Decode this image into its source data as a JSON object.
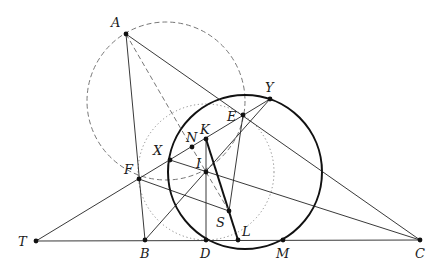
{
  "figure": {
    "type": "geometry-diagram",
    "points": {
      "A": {
        "label": "A",
        "x": 126,
        "y": 34
      },
      "B": {
        "label": "B",
        "x": 145,
        "y": 240
      },
      "C": {
        "label": "C",
        "x": 420,
        "y": 240
      },
      "T": {
        "label": "T",
        "x": 36,
        "y": 241
      },
      "D": {
        "label": "D",
        "x": 206,
        "y": 240
      },
      "L": {
        "label": "L",
        "x": 238,
        "y": 240
      },
      "M": {
        "label": "M",
        "x": 283,
        "y": 240
      },
      "F": {
        "label": "F",
        "x": 139,
        "y": 179
      },
      "E": {
        "label": "E",
        "x": 243,
        "y": 115
      },
      "Y": {
        "label": "Y",
        "x": 270,
        "y": 99
      },
      "X": {
        "label": "X",
        "x": 170,
        "y": 160
      },
      "N": {
        "label": "N",
        "x": 192,
        "y": 147
      },
      "K": {
        "label": "K",
        "x": 206,
        "y": 139
      },
      "I": {
        "label": "I",
        "x": 206,
        "y": 172
      },
      "S": {
        "label": "S",
        "x": 229,
        "y": 211
      }
    },
    "circles": [
      {
        "name": "bold-circle",
        "style": "solid-bold",
        "cx": 245,
        "cy": 172,
        "r": 77
      },
      {
        "name": "dashed-circle",
        "style": "dashed",
        "cx": 166,
        "cy": 101,
        "r": 79
      },
      {
        "name": "dotted-circle",
        "style": "dotted",
        "cx": 206,
        "cy": 172,
        "r": 68
      }
    ],
    "segments": [
      {
        "from": "A",
        "to": "B",
        "style": "solid"
      },
      {
        "from": "A",
        "to": "C",
        "style": "solid"
      },
      {
        "from": "T",
        "to": "C",
        "style": "solid"
      },
      {
        "from": "T",
        "to": "Y",
        "style": "solid"
      },
      {
        "from": "B",
        "to": "Y",
        "style": "solid"
      },
      {
        "from": "X",
        "to": "C",
        "style": "solid"
      },
      {
        "from": "F",
        "to": "S",
        "style": "solid"
      },
      {
        "from": "E",
        "to": "S",
        "style": "solid"
      },
      {
        "from": "K",
        "to": "D",
        "style": "solid"
      },
      {
        "from": "K",
        "to": "L",
        "style": "bold"
      },
      {
        "from": "A",
        "to": "I",
        "style": "dashed"
      },
      {
        "from": "I",
        "to": "S",
        "style": "dashed"
      }
    ]
  }
}
